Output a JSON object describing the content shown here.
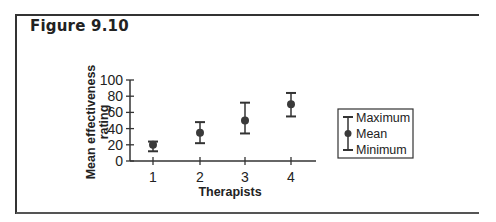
{
  "figure": {
    "title": "Figure 9.10"
  },
  "chart_data": {
    "type": "scatter",
    "title": "Figure 9.10",
    "xlabel": "Therapists",
    "ylabel": "Mean effectiveness rating",
    "ylabel_lines": [
      "Mean effectiveness",
      "rating"
    ],
    "categories": [
      "1",
      "2",
      "3",
      "4"
    ],
    "yticks": [
      0,
      20,
      40,
      60,
      80,
      100
    ],
    "ylim": [
      0,
      100
    ],
    "grid": false,
    "legend_position": "right",
    "series": [
      {
        "name": "Mean",
        "values": [
          20,
          35,
          50,
          70
        ]
      },
      {
        "name": "Maximum",
        "values": [
          24,
          48,
          72,
          84
        ]
      },
      {
        "name": "Minimum",
        "values": [
          12,
          22,
          34,
          55
        ]
      }
    ],
    "legend": [
      "Maximum",
      "Mean",
      "Minimum"
    ]
  },
  "colors": {
    "ink": "#333333",
    "marker": "#3a3a3a",
    "frame": "#333333"
  }
}
